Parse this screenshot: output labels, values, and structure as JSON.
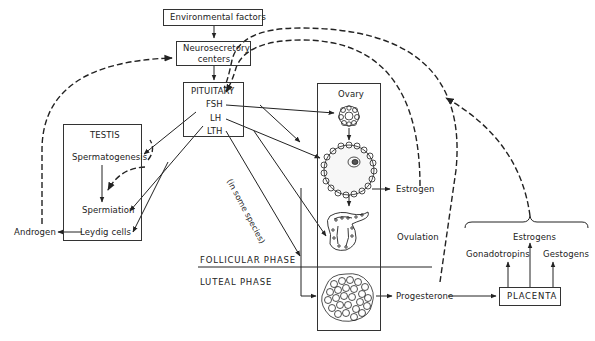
{
  "diagram": {
    "nodes": {
      "environmental_factors": "Environmental factors",
      "neurosecretory_line1": "Neurosecretory",
      "neurosecretory_line2": "centers",
      "pituitary": "PITUITARY",
      "fsh": "FSH",
      "lh": "LH",
      "lth": "LTH",
      "testis": "TESTIS",
      "spermatogenesis": "Spermatogenesis",
      "spermiation": "Spermiation",
      "leydig_cells": "Leydig cells",
      "androgen": "Androgen",
      "ovary": "Ovary",
      "estrogen": "Estrogen",
      "ovulation": "Ovulation",
      "progesterone": "Progesterone",
      "placenta": "PLACENTA",
      "gonadotropins": "Gonadotropins",
      "estrogens": "Estrogens",
      "gestogens": "Gestogens"
    },
    "annotations": {
      "in_some_species": "(in some species)",
      "follicular_phase": "FOLLICULAR  PHASE",
      "luteal_phase": "LUTEAL  PHASE"
    },
    "colors": {
      "line": "#222222",
      "background": "#ffffff"
    }
  }
}
